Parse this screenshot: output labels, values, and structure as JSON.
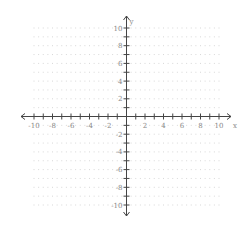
{
  "chart_data": {
    "type": "scatter",
    "title": "",
    "xlabel": "x",
    "ylabel": "y",
    "xlim": [
      -10,
      10
    ],
    "ylim": [
      -10,
      10
    ],
    "grid": "dotted",
    "x_ticks": [
      -10,
      -9,
      -8,
      -7,
      -6,
      -5,
      -4,
      -3,
      -2,
      -1,
      1,
      2,
      3,
      4,
      5,
      6,
      7,
      8,
      9,
      10
    ],
    "x_tick_labels": [
      "-10",
      "-8",
      "-6",
      "-4",
      "-2",
      "2",
      "4",
      "6",
      "8",
      "10"
    ],
    "y_ticks": [
      -10,
      -9,
      -8,
      -7,
      -6,
      -5,
      -4,
      -3,
      -2,
      -1,
      1,
      2,
      3,
      4,
      5,
      6,
      7,
      8,
      9,
      10
    ],
    "y_tick_labels": [
      "10",
      "8",
      "6",
      "4",
      "2",
      "-2",
      "-4",
      "-6",
      "-8",
      "-10"
    ],
    "series": []
  },
  "axes": {
    "x_label": "x",
    "y_label": "y"
  },
  "colors": {
    "axis": "#444444",
    "grid_dot": "#d8d8d8",
    "label": "#888888"
  }
}
